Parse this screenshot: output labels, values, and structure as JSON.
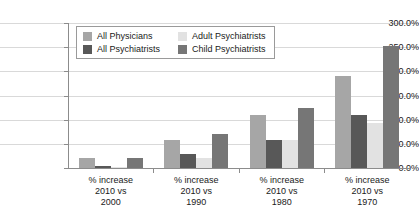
{
  "chart_data": {
    "type": "bar",
    "title": "",
    "xlabel": "",
    "ylabel": "",
    "ylim": [
      0,
      300
    ],
    "grid": true,
    "legend_position": "top-left-inside",
    "ytick_labels": [
      "300.0%",
      "250.0%",
      "200.0%",
      "150.0%",
      "100.0%",
      "50.0%",
      "0.0%"
    ],
    "ytick_values": [
      300,
      250,
      200,
      150,
      100,
      50,
      0
    ],
    "categories": [
      "% increase\n2010 vs\n2000",
      "% increase\n2010 vs\n1990",
      "% increase\n2010 vs\n1980",
      "% increase\n2010 vs\n1970"
    ],
    "category_lines": [
      [
        "% increase",
        "2010 vs",
        "2000"
      ],
      [
        "% increase",
        "2010 vs",
        "1990"
      ],
      [
        "% increase",
        "2010 vs",
        "1980"
      ],
      [
        "% increase",
        "2010 vs",
        "1970"
      ]
    ],
    "series": [
      {
        "name": "All Physicians",
        "color": "#a6a6a6",
        "values": [
          20,
          57,
          110,
          190
        ]
      },
      {
        "name": "All Psychiatrists",
        "color": "#585858",
        "values": [
          5,
          28,
          57,
          110
        ]
      },
      {
        "name": "Adult Psychiatrists",
        "color": "#e2e2e2",
        "values": [
          1,
          20,
          57,
          93
        ]
      },
      {
        "name": "Child Psychiatrists",
        "color": "#767676",
        "values": [
          20,
          70,
          125,
          252
        ]
      }
    ]
  }
}
